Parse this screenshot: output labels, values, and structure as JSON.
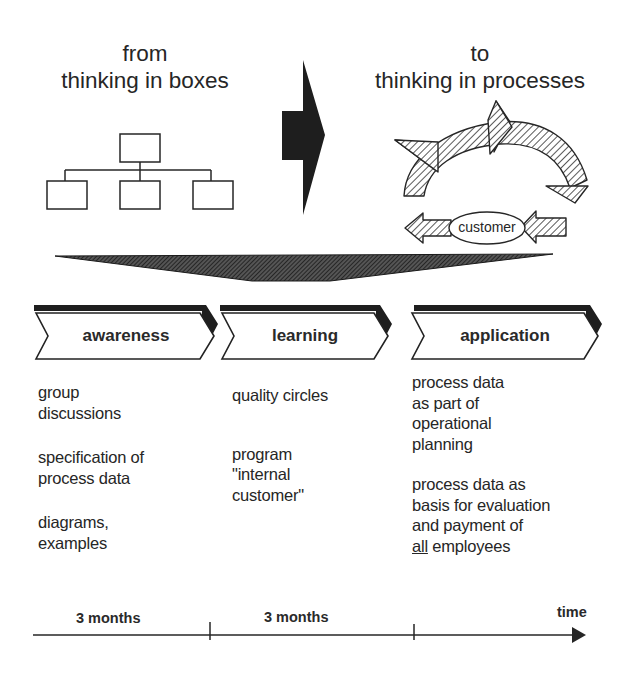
{
  "header": {
    "left": {
      "line1": "from",
      "line2": "thinking in boxes"
    },
    "right": {
      "line1": "to",
      "line2": "thinking in processes"
    }
  },
  "process_cycle": {
    "center_label": "customer"
  },
  "phases": [
    {
      "label": "awareness",
      "items": [
        "group discussions",
        "specification of process data",
        "diagrams, examples"
      ]
    },
    {
      "label": "learning",
      "items": [
        "quality circles",
        "program \"internal customer\""
      ]
    },
    {
      "label": "application",
      "items": [
        "process data as part of operational planning",
        "process data as basis for evaluation and payment of all employees"
      ]
    }
  ],
  "phase_text": {
    "awareness": {
      "item1_l1": "group",
      "item1_l2": "discussions",
      "item2_l1": "specification of",
      "item2_l2": "process data",
      "item3_l1": "diagrams,",
      "item3_l2": "examples"
    },
    "learning": {
      "item1_l1": "quality circles",
      "item2_l1": "program",
      "item2_l2": "\"internal",
      "item2_l3": "customer\""
    },
    "application": {
      "item1_l1": "process data",
      "item1_l2": "as part of",
      "item1_l3": "operational",
      "item1_l4": "planning",
      "item2_l1": "process data as",
      "item2_l2": "basis for evaluation",
      "item2_l3": "and payment of",
      "item2_l4_underlined": "all",
      "item2_l4_rest": " employees"
    }
  },
  "timeline": {
    "segments": [
      "3 months",
      "3 months"
    ],
    "axis_label": "time"
  },
  "colors": {
    "ink": "#262626",
    "dark_fill": "#1e1e1e",
    "hatch": "#3a3a3a",
    "background": "#ffffff"
  }
}
